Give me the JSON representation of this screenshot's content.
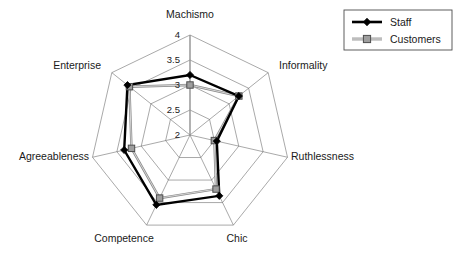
{
  "chart_data": {
    "type": "radar",
    "title": "",
    "categories": [
      "Machismo",
      "Informality",
      "Ruthlessness",
      "Chic",
      "Competence",
      "Agreeableness",
      "Enterprise"
    ],
    "series": [
      {
        "name": "Staff",
        "color": "#000000",
        "marker": "diamond",
        "values": [
          3.2,
          3.25,
          2.55,
          3.35,
          3.55,
          3.35,
          3.6
        ]
      },
      {
        "name": "Customers",
        "color": "#9e9e9e",
        "marker": "square",
        "values": [
          3.0,
          3.25,
          2.5,
          3.2,
          3.4,
          3.2,
          3.55
        ]
      }
    ],
    "rticks": [
      2,
      2.5,
      3,
      3.5,
      4
    ],
    "rtick_labels": [
      "2",
      "2.5",
      "3",
      "3.5",
      "4"
    ],
    "rlim": [
      2,
      4
    ],
    "grid": true,
    "legend_position": "top-right",
    "xlabel": "",
    "ylabel": ""
  },
  "legend": {
    "entries": [
      {
        "label": "Staff"
      },
      {
        "label": "Customers"
      }
    ]
  },
  "axis_labels": {
    "machismo": "Machismo",
    "informality": "Informality",
    "ruthlessness": "Ruthlessness",
    "chic": "Chic",
    "competence": "Competence",
    "agreeableness": "Agreeableness",
    "enterprise": "Enterprise"
  },
  "tick_labels": {
    "t4": "4",
    "t35": "3.5",
    "t3": "3",
    "t25": "2.5",
    "t2": "2"
  },
  "colors": {
    "staff": "#000000",
    "customers": "#9e9e9e",
    "grid": "#6e6e6e",
    "background": "#ffffff"
  }
}
